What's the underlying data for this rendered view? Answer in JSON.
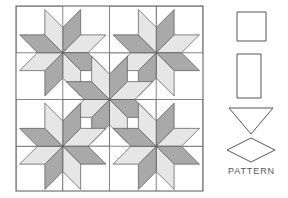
{
  "figure": {
    "kind": "quilt-pattern-diagram",
    "background_color": "#ffffff"
  },
  "quilt": {
    "name": "eight-pointed-star-quilt",
    "title": "",
    "bounds": {
      "x": 16,
      "y": 6,
      "width": 187,
      "height": 185
    },
    "grid": {
      "columns": 4,
      "rows": 4,
      "cell": 46.75
    },
    "colors": {
      "background": "#ffffff",
      "patch_light": "#e6e6e6",
      "patch_dark": "#a9a9a9",
      "patch_white": "#ffffff",
      "outline": "#555555",
      "border": "#666666"
    },
    "star_centers": [
      {
        "id": "star-top-left",
        "cx": 1,
        "cy": 1
      },
      {
        "id": "star-top-right",
        "cx": 3,
        "cy": 1
      },
      {
        "id": "star-center",
        "cx": 2,
        "cy": 2
      },
      {
        "id": "star-bottom-left",
        "cx": 1,
        "cy": 3
      },
      {
        "id": "star-bottom-right",
        "cx": 3,
        "cy": 3
      }
    ],
    "star_point_shades": [
      "dark",
      "light",
      "dark",
      "light",
      "dark",
      "light",
      "dark",
      "light"
    ],
    "corner_squares": [
      {
        "id": "corner-square-top-left",
        "col": 0,
        "row": 0
      },
      {
        "id": "corner-square-top-right",
        "col": 3,
        "row": 0
      },
      {
        "id": "corner-square-bottom-left",
        "col": 0,
        "row": 3
      },
      {
        "id": "corner-square-bottom-right",
        "col": 3,
        "row": 3
      }
    ],
    "edge_squares": [
      {
        "id": "edge-square-top",
        "col": 2,
        "row": 0
      },
      {
        "id": "edge-square-left",
        "col": 0,
        "row": 2
      },
      {
        "id": "edge-square-right",
        "col": 3,
        "row": 2
      },
      {
        "id": "edge-square-bottom",
        "col": 1,
        "row": 3
      }
    ],
    "inner_white_squares": [
      {
        "id": "inner-square-1",
        "col": 1,
        "row": 1
      },
      {
        "id": "inner-square-2",
        "col": 2,
        "row": 1
      },
      {
        "id": "inner-square-3",
        "col": 1,
        "row": 2
      },
      {
        "id": "inner-square-4",
        "col": 2,
        "row": 2
      }
    ]
  },
  "legend": {
    "name": "pattern-templates",
    "label": "PATTERN",
    "shapes": [
      {
        "id": "template-square",
        "name": "square-template",
        "shape": "square",
        "x": 237,
        "y": 12,
        "width": 29,
        "height": 29
      },
      {
        "id": "template-rectangle",
        "name": "rectangle-template",
        "shape": "rectangle",
        "x": 237,
        "y": 54,
        "width": 24,
        "height": 44
      },
      {
        "id": "template-triangle",
        "name": "triangle-template",
        "shape": "triangle-down",
        "x": 229,
        "y": 108,
        "width": 44,
        "height": 26
      },
      {
        "id": "template-diamond",
        "name": "diamond-template",
        "shape": "diamond",
        "x": 227,
        "y": 138,
        "width": 48,
        "height": 24
      }
    ],
    "stroke_color": "#555555"
  }
}
